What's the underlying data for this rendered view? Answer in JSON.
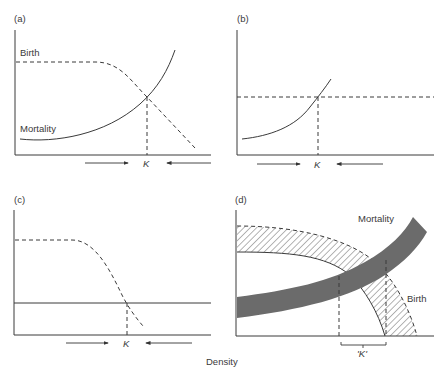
{
  "figure": {
    "x_axis_label": "Density",
    "colors": {
      "line": "#3a3a3a",
      "band_fill": "#6b6b6b",
      "hatch": "#5a5a5a",
      "background": "#ffffff"
    }
  },
  "panels": [
    {
      "id": "a",
      "label": "(a)",
      "curves": [
        {
          "name": "Birth",
          "label": "Birth",
          "style": "dashed",
          "shape": "constant then decreasing with density"
        },
        {
          "name": "Mortality",
          "label": "Mortality",
          "style": "solid",
          "shape": "increasing with density"
        }
      ],
      "equilibrium_label": "K",
      "arrows": [
        "right-pointing toward K",
        "left-pointing toward K"
      ]
    },
    {
      "id": "b",
      "label": "(b)",
      "curves": [
        {
          "name": "Birth",
          "label": "",
          "style": "dashed",
          "shape": "constant (density independent)"
        },
        {
          "name": "Mortality",
          "label": "",
          "style": "solid",
          "shape": "increasing with density"
        }
      ],
      "equilibrium_label": "K",
      "arrows": [
        "right-pointing toward K",
        "left-pointing toward K"
      ]
    },
    {
      "id": "c",
      "label": "(c)",
      "curves": [
        {
          "name": "Birth",
          "label": "",
          "style": "dashed",
          "shape": "constant then decreasing with density"
        },
        {
          "name": "Mortality",
          "label": "",
          "style": "solid",
          "shape": "constant (density independent)"
        }
      ],
      "equilibrium_label": "K",
      "arrows": [
        "right-pointing toward K",
        "left-pointing toward K"
      ]
    },
    {
      "id": "d",
      "label": "(d)",
      "curves": [
        {
          "name": "Mortality",
          "label": "Mortality",
          "style": "gray band",
          "shape": "increasing band with density"
        },
        {
          "name": "Birth",
          "label": "Birth",
          "style": "hatched band",
          "shape": "decreasing band with density"
        }
      ],
      "equilibrium_label": "'K'",
      "equilibrium_marker": "bracket spanning range of densities"
    }
  ]
}
